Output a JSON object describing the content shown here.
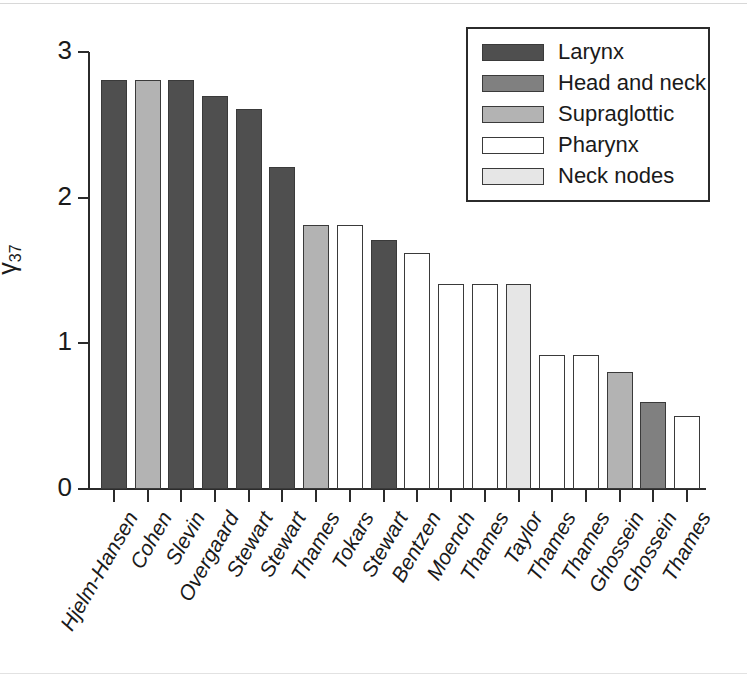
{
  "chart_data": {
    "type": "bar",
    "title": "",
    "subtitle": "",
    "xlabel": "",
    "ylabel": "γ37",
    "ylabel_base": "γ",
    "ylabel_sub": "37",
    "ylim": [
      0,
      3
    ],
    "yticks": [
      0,
      1,
      2,
      3
    ],
    "ytick_labels": [
      "0",
      "1",
      "2",
      "3"
    ],
    "grid": false,
    "legend_position": "top-right",
    "categories": [
      "Hjelm-Hansen",
      "Cohen",
      "Slevin",
      "Overgaard",
      "Stewart",
      "Stewart",
      "Thames",
      "Tokars",
      "Stewart",
      "Bentzen",
      "Moench",
      "Thames",
      "Taylor",
      "Thames",
      "Thames",
      "Ghossein",
      "Ghossein",
      "Thames"
    ],
    "values": [
      2.81,
      2.81,
      2.81,
      2.7,
      2.61,
      2.21,
      1.81,
      1.81,
      1.71,
      1.62,
      1.41,
      1.41,
      1.41,
      0.92,
      0.92,
      0.8,
      0.6,
      0.5
    ],
    "bar_groups": [
      "Larynx",
      "Supraglottic",
      "Larynx",
      "Larynx",
      "Larynx",
      "Larynx",
      "Supraglottic",
      "Pharynx",
      "Larynx",
      "Pharynx",
      "Pharynx",
      "Pharynx",
      "Neck nodes",
      "Pharynx",
      "Pharynx",
      "Supraglottic",
      "Head and neck",
      "Pharynx"
    ],
    "legend": [
      {
        "label": "Larynx",
        "color": "#4f4f4f"
      },
      {
        "label": "Head and neck",
        "color": "#808080"
      },
      {
        "label": "Supraglottic",
        "color": "#b3b3b3"
      },
      {
        "label": "Pharynx",
        "color": "#ffffff"
      },
      {
        "label": "Neck nodes",
        "color": "#e6e6e6"
      }
    ],
    "group_colors": {
      "Larynx": "#4f4f4f",
      "Head and neck": "#808080",
      "Supraglottic": "#b3b3b3",
      "Pharynx": "#ffffff",
      "Neck nodes": "#e6e6e6"
    },
    "axis_color": "#2b2b2b",
    "bar_outline_color": "#3a3a3a"
  }
}
